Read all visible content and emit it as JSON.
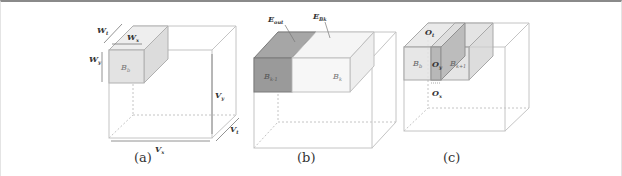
{
  "figure": {
    "panels": [
      {
        "id": "a",
        "caption": "(a)",
        "labels": {
          "w_t": "W",
          "w_t_sub": "t",
          "w_x": "W",
          "w_x_sub": "x",
          "w_y": "W",
          "w_y_sub": "y",
          "block": "B",
          "block_sub": "b",
          "v_y": "V",
          "v_y_sub": "y",
          "v_x": "V",
          "v_x_sub": "x",
          "v_t": "V",
          "v_t_sub": "t"
        }
      },
      {
        "id": "b",
        "caption": "(b)",
        "labels": {
          "e_out": "E",
          "e_out_sub": "out",
          "e_b": "E",
          "e_b_sub": "Bk",
          "block_prev": "B",
          "block_prev_sub": "k-1",
          "block": "B",
          "block_sub": "k"
        }
      },
      {
        "id": "c",
        "caption": "(c)",
        "labels": {
          "o_t": "O",
          "o_t_sub": "t",
          "o_y": "O",
          "o_y_sub": "y",
          "o_x": "O",
          "o_x_sub": "x",
          "block": "B",
          "block_sub": "b",
          "block_next": "B",
          "block_next_sub": "k+1"
        }
      }
    ],
    "colors": {
      "dark_block": "#9a9a9a",
      "light_block": "#e6e6e6",
      "volume_edge": "#bdbdbd",
      "text": "#333333"
    }
  }
}
